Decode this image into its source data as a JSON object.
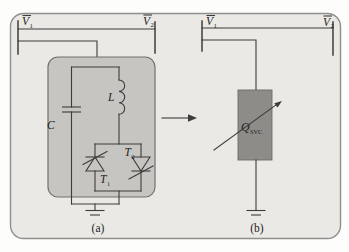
{
  "figure": {
    "type": "circuit-diagram",
    "panel_a": {
      "caption": "(a)",
      "bus_labels": {
        "left": {
          "base": "V",
          "sub": "1",
          "overline": true
        },
        "right": {
          "base": "V",
          "sub": "2",
          "overline": true
        }
      },
      "capacitor_label": "C",
      "inductor_label": "L",
      "thyristor_left_label": {
        "base": "T",
        "sub": "1"
      },
      "thyristor_right_label": {
        "base": "T",
        "sub": "2"
      }
    },
    "panel_b": {
      "caption": "(b)",
      "bus_labels": {
        "left": {
          "base": "V",
          "sub": "1",
          "overline": true
        },
        "right": {
          "base": "V",
          "sub": "2",
          "overline": true
        }
      },
      "svc_label": {
        "base": "Q",
        "sub": "SVC"
      }
    },
    "icons": {
      "transform": "right-arrow",
      "svc_variable": "diagonal-arrow",
      "ground": "earth-ground"
    },
    "colors": {
      "page_bg": "#fdfdfb",
      "panel_fill": "#eae9e5",
      "panel_border": "#8f8f8c",
      "component_box_fill": "#c6c5c1",
      "component_box_border": "#72716e",
      "svc_box_fill": "#8d8c89",
      "svc_box_border": "#6b6a67",
      "wire": "#3d3c3a",
      "text": "#1e1d1b"
    }
  }
}
